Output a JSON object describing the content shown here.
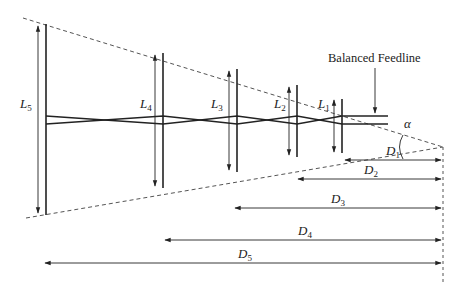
{
  "diagram": {
    "colors": {
      "line": "#222222",
      "dashed": "#555555",
      "background": "#ffffff"
    },
    "apex": {
      "x": 443,
      "y": 147
    },
    "feedline_label": "Balanced Feedline",
    "angle_label": "α",
    "elements": [
      {
        "name": "L1",
        "letter": "L",
        "sub": "1",
        "x": 342,
        "top": 99,
        "bottom": 153,
        "arrow_x": 333,
        "label_x": 318,
        "label_y": 112
      },
      {
        "name": "L2",
        "letter": "L",
        "sub": "2",
        "x": 297,
        "top": 85,
        "bottom": 157,
        "arrow_x": 289,
        "label_x": 273,
        "label_y": 112
      },
      {
        "name": "L3",
        "letter": "L",
        "sub": "3",
        "x": 237,
        "top": 69,
        "bottom": 172,
        "arrow_x": 229,
        "label_x": 211,
        "label_y": 112
      },
      {
        "name": "L4",
        "letter": "L",
        "sub": "4",
        "x": 163,
        "top": 53,
        "bottom": 188,
        "arrow_x": 155,
        "label_x": 140,
        "label_y": 112
      },
      {
        "name": "L5",
        "letter": "L",
        "sub": "5",
        "x": 46,
        "top": 24,
        "bottom": 215,
        "arrow_x": 38,
        "label_x": 22,
        "label_y": 112
      }
    ],
    "distances": [
      {
        "name": "D1",
        "letter": "D",
        "sub": "1",
        "y": 160,
        "from_x": 345,
        "label_x": 386,
        "label_y": 155
      },
      {
        "name": "D2",
        "letter": "D",
        "sub": "2",
        "y": 179,
        "from_x": 298,
        "label_x": 364,
        "label_y": 174
      },
      {
        "name": "D3",
        "letter": "D",
        "sub": "3",
        "y": 208,
        "from_x": 235,
        "label_x": 331,
        "label_y": 203
      },
      {
        "name": "D4",
        "letter": "D",
        "sub": "4",
        "y": 240,
        "from_x": 165,
        "label_x": 298,
        "label_y": 235
      },
      {
        "name": "D5",
        "letter": "D",
        "sub": "5",
        "y": 263,
        "from_x": 45,
        "label_x": 238,
        "label_y": 258
      }
    ]
  }
}
